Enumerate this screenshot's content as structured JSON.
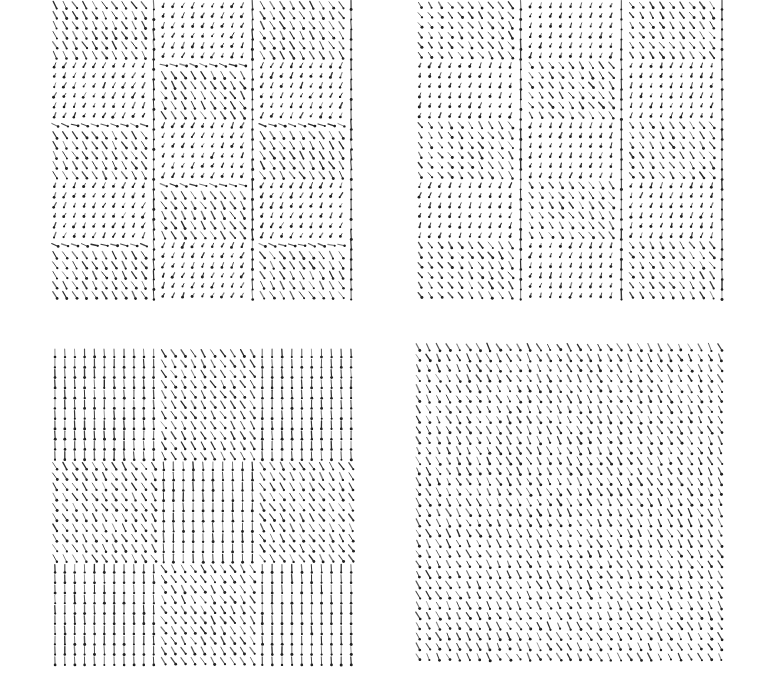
{
  "figure": {
    "background": "#ffffff",
    "ink": "#222222",
    "panels": [
      {
        "id": "top-left",
        "x": 50,
        "y": 0,
        "width": 306,
        "height": 300,
        "cols": 31,
        "rows": 30,
        "pattern": "checkerboard-3x5",
        "block_cols": 3,
        "block_rows": 5,
        "description": "Checkerboard of domains: tilted (diagonal) cells alternate with dot/short-tilt cells, separated by vertical and horizontal walls"
      },
      {
        "id": "top-right",
        "x": 415,
        "y": 0,
        "width": 312,
        "height": 300,
        "cols": 31,
        "rows": 30,
        "pattern": "vertical-stripes-wavy",
        "block_cols": 3,
        "block_rows": 5,
        "description": "Vertical domain walls with alternating diagonal / dot bands"
      },
      {
        "id": "bottom-left",
        "x": 50,
        "y": 348,
        "width": 306,
        "height": 318,
        "cols": 31,
        "rows": 31,
        "pattern": "mostly-vertical-diagonal-bands",
        "block_cols": 3,
        "block_rows": 3,
        "description": "Mostly vertical arrows with diagonal tilted bands"
      },
      {
        "id": "bottom-right",
        "x": 413,
        "y": 342,
        "width": 312,
        "height": 320,
        "cols": 31,
        "rows": 31,
        "pattern": "uniform-diagonal",
        "block_cols": 1,
        "block_rows": 1,
        "description": "Nearly uniform diagonal tilt with small random variation"
      }
    ]
  }
}
